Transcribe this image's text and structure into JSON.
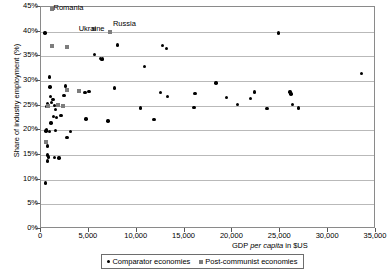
{
  "chart_data": {
    "type": "scatter",
    "title": "",
    "xlabel": "GDP per capita in $US",
    "ylabel": "Share of industry employment (%)",
    "xlim": [
      0,
      35000
    ],
    "ylim": [
      0,
      0.45
    ],
    "grid": true,
    "legend_position": "bottom",
    "x_ticks": [
      "0",
      "5,000",
      "10,000",
      "15,000",
      "20,000",
      "25,000",
      "30,000",
      "35,000"
    ],
    "x_tick_values": [
      0,
      5000,
      10000,
      15000,
      20000,
      25000,
      30000,
      35000
    ],
    "y_ticks": [
      "0%",
      "5%",
      "10%",
      "15%",
      "20%",
      "25%",
      "30%",
      "35%",
      "40%",
      "45%"
    ],
    "y_tick_values": [
      0,
      5,
      10,
      15,
      20,
      25,
      30,
      35,
      40,
      45
    ],
    "series": [
      {
        "name": "Comparator economies",
        "marker": "circle",
        "color": "#000000",
        "points": [
          [
            400,
            39.7
          ],
          [
            900,
            30.8
          ],
          [
            950,
            28.8
          ],
          [
            1000,
            26.9
          ],
          [
            700,
            25.5
          ],
          [
            800,
            25.0
          ],
          [
            600,
            24.8
          ],
          [
            1100,
            25.6
          ],
          [
            1250,
            26.3
          ],
          [
            1400,
            25.0
          ],
          [
            1500,
            24.2
          ],
          [
            1300,
            22.8
          ],
          [
            1600,
            22.6
          ],
          [
            1050,
            21.5
          ],
          [
            600,
            20.1
          ],
          [
            520,
            19.9
          ],
          [
            900,
            19.8
          ],
          [
            1500,
            20.0
          ],
          [
            700,
            16.8
          ],
          [
            650,
            15.0
          ],
          [
            800,
            14.6
          ],
          [
            700,
            13.8
          ],
          [
            1400,
            14.5
          ],
          [
            1900,
            14.4
          ],
          [
            450,
            9.3
          ],
          [
            2550,
            29.0
          ],
          [
            2400,
            27.1
          ],
          [
            2100,
            23.0
          ],
          [
            2700,
            18.6
          ],
          [
            3100,
            19.8
          ],
          [
            4600,
            27.7
          ],
          [
            5000,
            27.9
          ],
          [
            4700,
            22.3
          ],
          [
            5600,
            35.4
          ],
          [
            6200,
            34.6
          ],
          [
            6400,
            34.5
          ],
          [
            6300,
            34.3
          ],
          [
            7700,
            28.6
          ],
          [
            7000,
            21.9
          ],
          [
            8000,
            37.3
          ],
          [
            10800,
            33.0
          ],
          [
            10400,
            24.5
          ],
          [
            12700,
            37.2
          ],
          [
            13100,
            36.6
          ],
          [
            12500,
            27.7
          ],
          [
            13200,
            26.8
          ],
          [
            11800,
            22.2
          ],
          [
            16100,
            27.5
          ],
          [
            16000,
            24.6
          ],
          [
            18300,
            29.6
          ],
          [
            19400,
            26.6
          ],
          [
            20500,
            25.2
          ],
          [
            22300,
            27.8
          ],
          [
            21900,
            26.5
          ],
          [
            24800,
            39.7
          ],
          [
            23600,
            24.4
          ],
          [
            26000,
            27.8
          ],
          [
            26100,
            27.4
          ],
          [
            26300,
            25.2
          ],
          [
            26900,
            24.5
          ],
          [
            33500,
            31.5
          ]
        ]
      },
      {
        "name": "Post-communist economies",
        "marker": "square",
        "color": "#7d7d7d",
        "points": [
          [
            1100,
            44.5
          ],
          [
            1150,
            37.0
          ],
          [
            2700,
            36.8
          ],
          [
            5500,
            40.5
          ],
          [
            7200,
            40.0
          ],
          [
            700,
            25.0
          ],
          [
            1750,
            25.1
          ],
          [
            2300,
            25.0
          ],
          [
            2700,
            28.2
          ],
          [
            4000,
            28.0
          ],
          [
            500,
            17.7
          ]
        ]
      }
    ],
    "annotations": [
      {
        "text": "Romania",
        "x": 1100,
        "y": 44.5,
        "dx": 3,
        "dy": 4
      },
      {
        "text": "Ukraine",
        "x": 5500,
        "y": 40.5,
        "dx": -14,
        "dy": 5
      },
      {
        "text": "Russia",
        "x": 7200,
        "y": 40.0,
        "dx": 4,
        "dy": -3
      }
    ]
  },
  "legend": {
    "items": [
      {
        "label": "Comparator economies",
        "marker": "circle"
      },
      {
        "label": "Post-communist economies",
        "marker": "square"
      }
    ]
  },
  "axis_titles": {
    "x_prefix": "GDP ",
    "x_italic": "per capita",
    "x_suffix": " in $US",
    "y": "Share of industry employment (%)"
  }
}
